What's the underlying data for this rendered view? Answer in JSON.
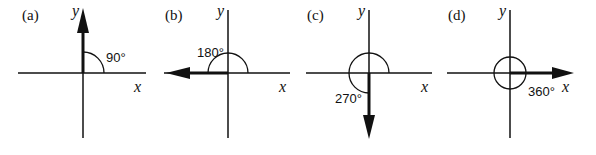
{
  "figure": {
    "panels": [
      {
        "label": "(a)",
        "angle_label": "90°",
        "x_axis": "x",
        "y_axis": "y",
        "arrow_direction": "up"
      },
      {
        "label": "(b)",
        "angle_label": "180°",
        "x_axis": "x",
        "y_axis": "y",
        "arrow_direction": "left"
      },
      {
        "label": "(c)",
        "angle_label": "270°",
        "x_axis": "x",
        "y_axis": "y",
        "arrow_direction": "down"
      },
      {
        "label": "(d)",
        "angle_label": "360°",
        "x_axis": "x",
        "y_axis": "y",
        "arrow_direction": "right"
      }
    ],
    "colors": {
      "ink": "#111111",
      "background": "#ffffff"
    }
  }
}
